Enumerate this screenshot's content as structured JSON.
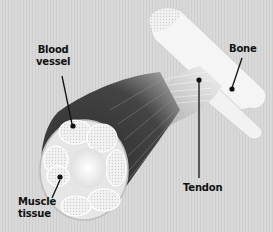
{
  "diagram": {
    "labels": {
      "blood_vessel": "Blood\nvessel",
      "bone": "Bone",
      "tendon": "Tendon",
      "muscle_tissue": "Muscle\ntissue"
    },
    "colors": {
      "background": "#d6d6d6",
      "muscle": "#3a3a3a",
      "bone": "#f4f4f4",
      "fiber_bundle": "#ececec",
      "leader_line": "#111111"
    }
  }
}
